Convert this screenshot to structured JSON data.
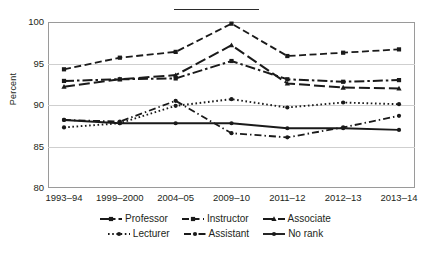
{
  "figure": {
    "y_axis_title": "Percent",
    "top_rule": "horizontal-rule"
  },
  "chart_data": {
    "type": "line",
    "title": "",
    "subtitle": "",
    "xlabel": "",
    "ylabel": "Percent",
    "ylim": [
      80,
      100
    ],
    "yticks": [
      80,
      85,
      90,
      95,
      100
    ],
    "grid": "horizontal",
    "legend_position": "bottom",
    "categories": [
      "1993–94",
      "1999–2000",
      "2004–05",
      "2009–10",
      "2011–12",
      "2012–13",
      "2013–14"
    ],
    "series": [
      {
        "name": "Professor",
        "marker": "square",
        "line_style": "dash-dot",
        "values": [
          92.9,
          93.1,
          93.2,
          95.3,
          93.1,
          92.8,
          93.0
        ]
      },
      {
        "name": "Instructor",
        "marker": "square",
        "line_style": "dashed",
        "values": [
          94.3,
          95.7,
          96.4,
          99.8,
          95.9,
          96.3,
          96.7
        ]
      },
      {
        "name": "Associate",
        "marker": "triangle",
        "line_style": "dashed-long",
        "values": [
          92.2,
          93.1,
          93.6,
          97.2,
          92.6,
          92.1,
          92.0
        ]
      },
      {
        "name": "Lecturer",
        "marker": "circle",
        "line_style": "dotted",
        "values": [
          87.3,
          87.8,
          89.9,
          90.7,
          89.7,
          90.3,
          90.1
        ]
      },
      {
        "name": "Assistant",
        "marker": "circle",
        "line_style": "dash-dot-fine",
        "values": [
          88.2,
          88.0,
          90.5,
          86.6,
          86.1,
          87.3,
          88.7
        ]
      },
      {
        "name": "No rank",
        "marker": "circle",
        "line_style": "solid",
        "values": [
          88.2,
          87.8,
          87.8,
          87.8,
          87.2,
          87.2,
          87.0
        ]
      }
    ]
  },
  "legend": {
    "rows": [
      [
        {
          "label": "Professor",
          "key": "legend-swatch-professor"
        },
        {
          "label": "Instructor",
          "key": "legend-swatch-instructor"
        },
        {
          "label": "Associate",
          "key": "legend-swatch-associate"
        }
      ],
      [
        {
          "label": "Lecturer",
          "key": "legend-swatch-lecturer"
        },
        {
          "label": "Assistant",
          "key": "legend-swatch-assistant"
        },
        {
          "label": "No rank",
          "key": "legend-swatch-no-rank"
        }
      ]
    ]
  },
  "colors": {
    "ink": "#231f20",
    "series": "#1a1a1a",
    "grid": "#cfcfcf",
    "frame": "#9a9a9a",
    "background": "#ffffff"
  }
}
